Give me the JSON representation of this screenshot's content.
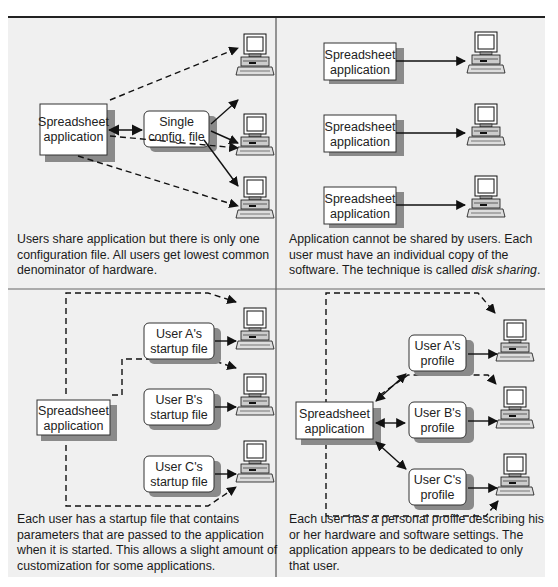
{
  "figure": {
    "panels": [
      {
        "id": "top-left",
        "app_box": {
          "line1": "Spreadsheet",
          "line2": "application"
        },
        "config_box": {
          "line1": "Single",
          "line2": "config. file"
        },
        "caption": "Users share application but there is only one configuration file. All users get lowest common denominator of hardware."
      },
      {
        "id": "top-right",
        "app_boxes": [
          {
            "line1": "Spreadsheet",
            "line2": "application"
          },
          {
            "line1": "Spreadsheet",
            "line2": "application"
          },
          {
            "line1": "Spreadsheet",
            "line2": "application"
          }
        ],
        "caption_prefix": "Application cannot be shared by users. Each user must have an individual copy of the software. The technique is called ",
        "caption_emphasis": "disk sharing",
        "caption_suffix": "."
      },
      {
        "id": "bottom-left",
        "app_box": {
          "line1": "Spreadsheet",
          "line2": "application"
        },
        "file_boxes": [
          {
            "line1": "User A's",
            "line2": "startup file"
          },
          {
            "line1": "User B's",
            "line2": "startup file"
          },
          {
            "line1": "User C's",
            "line2": "startup file"
          }
        ],
        "caption": "Each user has a startup file that contains parameters that are passed to the application when it is started. This allows a slight amount of customization for some applications."
      },
      {
        "id": "bottom-right",
        "app_box": {
          "line1": "Spreadsheet",
          "line2": "application"
        },
        "profile_boxes": [
          {
            "line1": "User A's",
            "line2": "profile"
          },
          {
            "line1": "User B's",
            "line2": "profile"
          },
          {
            "line1": "User C's",
            "line2": "profile"
          }
        ],
        "caption": "Each user has a personal profile describing his or her hardware and software settings. The application appears to be dedicated to only that user."
      }
    ],
    "icons": [
      "computer-icon"
    ],
    "colors": {
      "background": "#f0f0f0",
      "box_fill": "#ffffff",
      "box_shadow": "#8a8a8a",
      "line": "#111111"
    }
  }
}
